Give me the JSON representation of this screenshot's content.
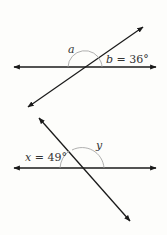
{
  "figure1": {
    "angle_a_label": "a",
    "angle_b_label": "b = 36°",
    "angle_b_value": 36
  },
  "figure2": {
    "angle_x_label": "x = 49°",
    "angle_x_value": 49,
    "angle_y_label": "y"
  },
  "colors": {
    "line": "#1a1a1a",
    "arc": "#9a9a9a",
    "text": "#333333"
  }
}
